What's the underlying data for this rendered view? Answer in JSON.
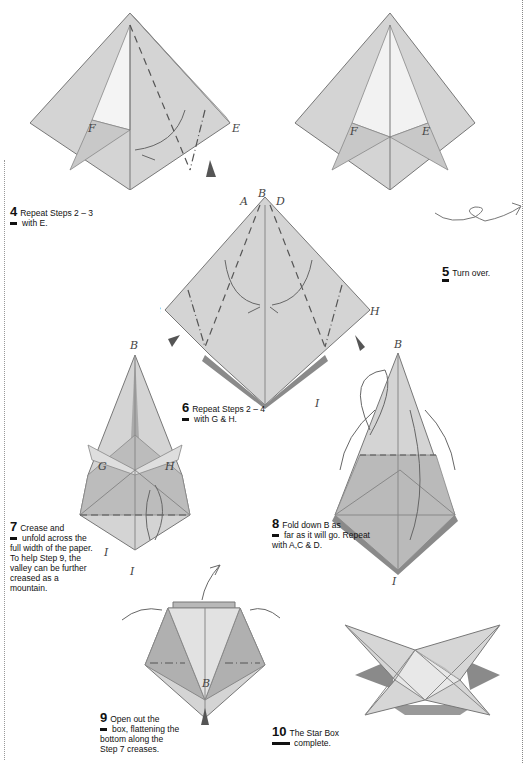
{
  "page": {
    "background": "#ffffff",
    "paper_color": "#d4d4d4",
    "paper_shadow": "#9a9a9a",
    "line_color": "#666666"
  },
  "steps": [
    {
      "number": "4",
      "first_line": "Repeat Steps 2 – 3",
      "rest": "with E."
    },
    {
      "number": "5",
      "first_line": "Turn over.",
      "rest": ""
    },
    {
      "number": "6",
      "first_line": "Repeat Steps 2 – 4",
      "rest": "with G & H."
    },
    {
      "number": "7",
      "first_line": "Crease and",
      "rest": "unfold across the full width of the paper. To help Step 9, the valley can be further creased as a mountain."
    },
    {
      "number": "8",
      "first_line": "Fold down B as",
      "rest": "far as it will go. Repeat with A,C & D."
    },
    {
      "number": "9",
      "first_line": "Open out the",
      "rest": "box, flattening the bottom along the Step 7 creases."
    },
    {
      "number": "10",
      "first_line": "The Star Box",
      "rest": "complete."
    }
  ],
  "diagram_labels": {
    "step3": {
      "F": "F",
      "E": "E"
    },
    "step4": {
      "F": "F",
      "E": "E"
    },
    "step6": {
      "A": "A",
      "B": "B",
      "D": "D",
      "G": "G",
      "H": "H",
      "I": "I"
    },
    "step7": {
      "B": "B",
      "G": "G",
      "H": "H",
      "I": "I"
    },
    "step8": {
      "B": "B",
      "I": "I"
    },
    "step9": {
      "B": "B",
      "I": "I"
    }
  }
}
